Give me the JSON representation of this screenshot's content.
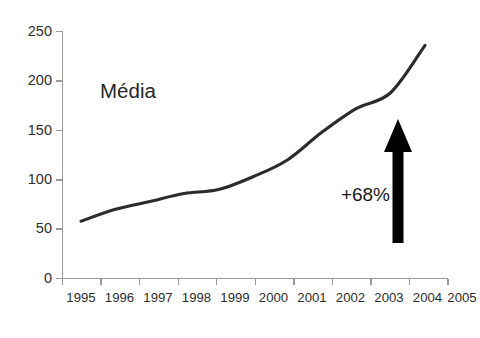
{
  "chart_data": {
    "type": "line",
    "title": "",
    "subtitle": "",
    "xlabel": "",
    "ylabel": "",
    "categories": [
      "1995",
      "1996",
      "1997",
      "1998",
      "1999",
      "2000",
      "2001",
      "2002",
      "2003",
      "2004",
      "2005"
    ],
    "series": [
      {
        "name": "Média",
        "values": [
          58,
          70,
          78,
          86,
          90,
          103,
          120,
          148,
          172,
          188,
          236
        ]
      }
    ],
    "xlim": [
      "1995",
      "2005"
    ],
    "ylim": [
      0,
      250
    ],
    "ytick_values": [
      0,
      50,
      100,
      150,
      200,
      250
    ],
    "ytick_labels": [
      "0",
      "50",
      "100",
      "150",
      "200",
      "250"
    ],
    "xtick_labels": [
      "1995",
      "1996",
      "1997",
      "1998",
      "1999",
      "2000",
      "2001",
      "2002",
      "2003",
      "2004",
      "2005"
    ],
    "grid": false,
    "legend": "none",
    "series_label_text": "Média",
    "annotations": [
      {
        "name": "growth-annotation",
        "text": "+68%",
        "arrow": "up",
        "arrow_anchor_year": "2004",
        "arrow_from_value": 48,
        "arrow_to_value": 175
      }
    ],
    "colors": {
      "line": "#2b2b2b",
      "axis": "#9a9a9a",
      "text": "#2e2e2e",
      "arrow": "#000000",
      "background": "#ffffff"
    }
  }
}
